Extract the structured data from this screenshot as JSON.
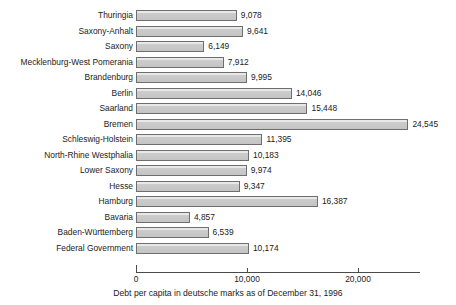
{
  "chart_data": {
    "type": "bar",
    "orientation": "horizontal",
    "title": "",
    "subtitle": "",
    "caption": "Debt per capita in deutsche marks as of December 31, 1996",
    "xlabel": "",
    "ylabel": "",
    "xlim": [
      0,
      25600
    ],
    "grid": false,
    "legend": null,
    "tick_labels": [
      "0",
      "10,000",
      "20,000"
    ],
    "ticks": [
      0,
      10000,
      20000
    ],
    "categories": [
      "Thuringia",
      "Saxony-Anhalt",
      "Saxony",
      "Mecklenburg-West Pomerania",
      "Brandenburg",
      "Berlin",
      "Saarland",
      "Bremen",
      "Schleswig-Holstein",
      "North-Rhine Westphalia",
      "Lower Saxony",
      "Hesse",
      "Hamburg",
      "Bavaria",
      "Baden-Württemberg",
      "Federal Government"
    ],
    "values": [
      9078,
      9641,
      6149,
      7912,
      9995,
      14046,
      15448,
      24545,
      11395,
      10183,
      9974,
      9347,
      16387,
      4857,
      6539,
      10174
    ],
    "value_labels": [
      "9,078",
      "9,641",
      "6,149",
      "7,912",
      "9,995",
      "14,046",
      "15,448",
      "24,545",
      "11,395",
      "10,183",
      "9,974",
      "9,347",
      "16,387",
      "4,857",
      "6,539",
      "10,174"
    ],
    "colors": {
      "bar_fill": "#c9c9c9",
      "bar_border": "#6e6e6e",
      "axis": "#4a4a4a",
      "text": "#1b1b1b",
      "background": "#ffffff"
    }
  }
}
